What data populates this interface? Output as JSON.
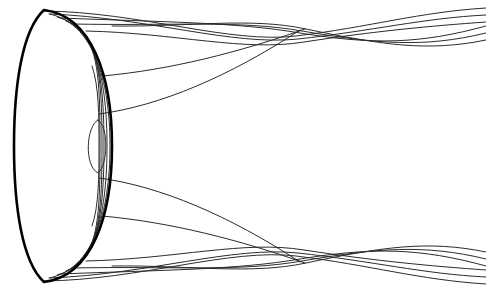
{
  "figure": {
    "width": 486,
    "height": 292,
    "background_color": "#ffffff",
    "stroke_color_primary": "#000000",
    "stroke_color_secondary": "#2b2b2b",
    "symmetry_axis_y": 146
  },
  "chart_data": {
    "type": "line",
    "xlabel": "",
    "ylabel": "",
    "xlim": [
      0,
      486
    ],
    "ylim": [
      0,
      292
    ],
    "grid": false,
    "legend": "none",
    "annotations": [],
    "series": [
      {
        "name": "lens-outer-boundary",
        "role": "outer-shell",
        "stroke": "#000000",
        "width": 2.6,
        "path": "M 44 10 C 92 16, 112 76, 112 146 C 112 216, 92 276, 44 282 C 22 262, 14 206, 14 146 C 14 86, 22 30, 44 10 Z"
      },
      {
        "name": "lens-rib-1",
        "role": "nested-contour",
        "stroke": "#2b2b2b",
        "width": 1,
        "path": "M 49 14 C 93 22, 110 80, 110 146 C 110 212, 93 270, 49 278"
      },
      {
        "name": "lens-rib-2",
        "role": "nested-contour",
        "stroke": "#2b2b2b",
        "width": 1,
        "path": "M 57 17 C 97 27, 107 84, 107 146 C 107 208, 97 265, 57 275"
      },
      {
        "name": "lens-rib-3",
        "role": "nested-contour",
        "stroke": "#2b2b2b",
        "width": 1,
        "path": "M 66 21 C 100 33, 104 88, 104 146 C 104 204, 100 259, 66 271"
      },
      {
        "name": "lens-rib-4",
        "role": "nested-contour",
        "stroke": "#2b2b2b",
        "width": 1,
        "path": "M 76 27 C 101 42, 102 94, 102 146 C 102 198, 101 250, 76 265"
      },
      {
        "name": "lens-rib-5",
        "role": "nested-contour",
        "stroke": "#2b2b2b",
        "width": 1,
        "path": "M 86 38 C 100 56, 100 100, 100 146 C 100 192, 100 236, 86 254"
      },
      {
        "name": "lens-rib-6",
        "role": "nested-contour",
        "stroke": "#2b2b2b",
        "width": 1,
        "path": "M 92 66 C 99 86, 99 116, 99 146 C 99 176, 99 206, 92 226"
      },
      {
        "name": "lens-inner-ellipse",
        "role": "innermost-contour",
        "stroke": "#2b2b2b",
        "width": 1,
        "path": "M 98 120 C 86 126, 84 166, 98 173 C 108 166, 109 126, 98 120 Z"
      },
      {
        "name": "sweep-upper-outer",
        "role": "ray-sweep",
        "stroke": "#2b2b2b",
        "width": 1,
        "path": "M 99 114 C 160 106, 230 76, 300 30"
      },
      {
        "name": "sweep-upper-inner",
        "role": "ray-sweep",
        "stroke": "#2b2b2b",
        "width": 1,
        "path": "M 102 76 C 170 70, 240 52, 305 29"
      },
      {
        "name": "sweep-lower-outer",
        "role": "ray-sweep",
        "stroke": "#2b2b2b",
        "width": 1,
        "path": "M 99 178 C 160 186, 230 216, 300 262"
      },
      {
        "name": "sweep-lower-inner",
        "role": "ray-sweep",
        "stroke": "#2b2b2b",
        "width": 1,
        "path": "M 102 216 C 170 222, 240 240, 305 263"
      },
      {
        "name": "braid-top-a",
        "role": "braid-strand",
        "band": "top",
        "stroke": "#2b2b2b",
        "width": 1,
        "path": "M 44 11 C 140 12, 230 44, 296 36 C 370 27, 420 12, 486 8"
      },
      {
        "name": "braid-top-b",
        "role": "braid-strand",
        "band": "top",
        "stroke": "#2b2b2b",
        "width": 1,
        "path": "M 50 14 C 150 18, 232 46, 298 39 C 372 31, 424 18, 486 15"
      },
      {
        "name": "braid-top-c",
        "role": "braid-strand",
        "band": "top",
        "stroke": "#2b2b2b",
        "width": 1,
        "path": "M 60 18 C 160 22, 236 22, 300 33 C 374 45, 420 44, 486 26"
      },
      {
        "name": "braid-top-d",
        "role": "braid-strand",
        "band": "top",
        "stroke": "#2b2b2b",
        "width": 1,
        "path": "M 72 24 C 170 26, 240 20, 302 31 C 378 44, 424 48, 486 33"
      },
      {
        "name": "braid-top-e",
        "role": "braid-strand",
        "band": "top",
        "stroke": "#2b2b2b",
        "width": 1,
        "path": "M 86 31 C 176 33, 244 52, 304 42 C 376 31, 430 26, 486 22"
      },
      {
        "name": "braid-top-f",
        "role": "braid-strand",
        "band": "top",
        "stroke": "#2b2b2b",
        "width": 1,
        "path": "M 112 26 C 190 27, 250 17, 306 29 C 382 45, 428 52, 486 40"
      },
      {
        "name": "braid-bottom-a",
        "role": "braid-strand",
        "band": "bottom",
        "stroke": "#2b2b2b",
        "width": 1,
        "path": "M 44 281 C 140 280, 230 248, 296 256 C 370 265, 420 280, 486 284"
      },
      {
        "name": "braid-bottom-b",
        "role": "braid-strand",
        "band": "bottom",
        "stroke": "#2b2b2b",
        "width": 1,
        "path": "M 50 278 C 150 274, 232 246, 298 253 C 372 261, 424 274, 486 277"
      },
      {
        "name": "braid-bottom-c",
        "role": "braid-strand",
        "band": "bottom",
        "stroke": "#2b2b2b",
        "width": 1,
        "path": "M 60 274 C 160 270, 236 270, 300 259 C 374 247, 420 248, 486 266"
      },
      {
        "name": "braid-bottom-d",
        "role": "braid-strand",
        "band": "bottom",
        "stroke": "#2b2b2b",
        "width": 1,
        "path": "M 72 268 C 170 266, 240 272, 302 261 C 378 248, 424 244, 486 259"
      },
      {
        "name": "braid-bottom-e",
        "role": "braid-strand",
        "band": "bottom",
        "stroke": "#2b2b2b",
        "width": 1,
        "path": "M 86 261 C 176 259, 244 240, 304 250 C 376 261, 430 266, 486 270"
      },
      {
        "name": "braid-bottom-f",
        "role": "braid-strand",
        "band": "bottom",
        "stroke": "#2b2b2b",
        "width": 1,
        "path": "M 112 266 C 190 265, 250 275, 306 263 C 382 247, 428 240, 486 252"
      }
    ]
  }
}
